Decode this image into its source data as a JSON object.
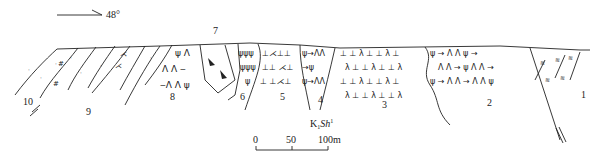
{
  "orientation": {
    "arrow_label": "48°"
  },
  "units": {
    "labels": [
      "1",
      "2",
      "3",
      "4",
      "5",
      "6",
      "7",
      "8",
      "9",
      "10"
    ]
  },
  "formation_label": {
    "main": "K",
    "sub": "1",
    "name": "Sh",
    "sup": "1"
  },
  "scale_bar": {
    "ticks": [
      "0",
      "50",
      "100m"
    ]
  },
  "colors": {
    "line": "#222222",
    "background": "#ffffff"
  }
}
